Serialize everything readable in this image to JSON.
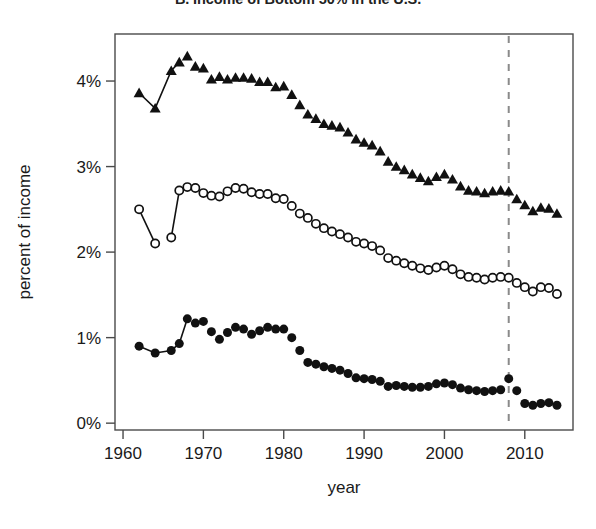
{
  "chart_data": {
    "type": "scatter",
    "title": "B. Income of Bottom 50% in the U.S.",
    "xlabel": "year",
    "ylabel": "percent of income",
    "xlim": [
      1959,
      2016
    ],
    "ylim": [
      -0.08,
      4.55
    ],
    "grid": false,
    "legend": "none",
    "xticks": [
      1960,
      1970,
      1980,
      1990,
      2000,
      2010
    ],
    "xtick_labels": [
      "1960",
      "1970",
      "1980",
      "1990",
      "2000",
      "2010"
    ],
    "yticks": [
      0,
      1,
      2,
      3,
      4
    ],
    "ytick_labels": [
      "0%",
      "1%",
      "2%",
      "3%",
      "4%"
    ],
    "annotations": [
      {
        "type": "vline",
        "x": 2008,
        "style": "dashed",
        "color": "#8a8a8a"
      }
    ],
    "series": [
      {
        "name": "top-series",
        "marker": "filled-triangle",
        "connected_segments": [
          [
            1962,
            1964,
            1966,
            1967
          ]
        ],
        "x": [
          1962,
          1964,
          1966,
          1967,
          1968,
          1969,
          1970,
          1971,
          1972,
          1973,
          1974,
          1975,
          1976,
          1977,
          1978,
          1979,
          1980,
          1981,
          1982,
          1983,
          1984,
          1985,
          1986,
          1987,
          1988,
          1989,
          1990,
          1991,
          1992,
          1993,
          1994,
          1995,
          1996,
          1997,
          1998,
          1999,
          2000,
          2001,
          2002,
          2003,
          2004,
          2005,
          2006,
          2007,
          2008,
          2009,
          2010,
          2011,
          2012,
          2013,
          2014
        ],
        "y": [
          3.86,
          3.68,
          4.12,
          4.22,
          4.29,
          4.17,
          4.15,
          4.02,
          4.05,
          4.02,
          4.04,
          4.04,
          4.03,
          3.99,
          3.99,
          3.93,
          3.94,
          3.84,
          3.72,
          3.61,
          3.56,
          3.5,
          3.48,
          3.46,
          3.4,
          3.32,
          3.28,
          3.25,
          3.18,
          3.06,
          3.0,
          2.96,
          2.91,
          2.87,
          2.83,
          2.88,
          2.91,
          2.85,
          2.77,
          2.72,
          2.71,
          2.69,
          2.71,
          2.72,
          2.71,
          2.62,
          2.55,
          2.48,
          2.52,
          2.51,
          2.45
        ]
      },
      {
        "name": "middle-series",
        "marker": "open-circle",
        "connected_segments": [
          [
            1962,
            1964
          ],
          [
            1966,
            1967
          ]
        ],
        "x": [
          1962,
          1964,
          1966,
          1967,
          1968,
          1969,
          1970,
          1971,
          1972,
          1973,
          1974,
          1975,
          1976,
          1977,
          1978,
          1979,
          1980,
          1981,
          1982,
          1983,
          1984,
          1985,
          1986,
          1987,
          1988,
          1989,
          1990,
          1991,
          1992,
          1993,
          1994,
          1995,
          1996,
          1997,
          1998,
          1999,
          2000,
          2001,
          2002,
          2003,
          2004,
          2005,
          2006,
          2007,
          2008,
          2009,
          2010,
          2011,
          2012,
          2013,
          2014
        ],
        "y": [
          2.5,
          2.1,
          2.17,
          2.72,
          2.76,
          2.75,
          2.69,
          2.66,
          2.65,
          2.71,
          2.75,
          2.74,
          2.7,
          2.68,
          2.68,
          2.63,
          2.62,
          2.54,
          2.45,
          2.4,
          2.33,
          2.28,
          2.24,
          2.21,
          2.17,
          2.12,
          2.1,
          2.07,
          2.02,
          1.93,
          1.9,
          1.87,
          1.84,
          1.81,
          1.79,
          1.82,
          1.84,
          1.8,
          1.74,
          1.71,
          1.7,
          1.68,
          1.7,
          1.71,
          1.7,
          1.64,
          1.59,
          1.54,
          1.59,
          1.58,
          1.51
        ]
      },
      {
        "name": "bottom-series",
        "marker": "filled-circle",
        "connected_segments": [
          [
            1962,
            1964,
            1966,
            1967
          ],
          [
            1967,
            1968
          ]
        ],
        "x": [
          1962,
          1964,
          1966,
          1967,
          1968,
          1969,
          1970,
          1971,
          1972,
          1973,
          1974,
          1975,
          1976,
          1977,
          1978,
          1979,
          1980,
          1981,
          1982,
          1983,
          1984,
          1985,
          1986,
          1987,
          1988,
          1989,
          1990,
          1991,
          1992,
          1993,
          1994,
          1995,
          1996,
          1997,
          1998,
          1999,
          2000,
          2001,
          2002,
          2003,
          2004,
          2005,
          2006,
          2007,
          2008,
          2009,
          2010,
          2011,
          2012,
          2013,
          2014
        ],
        "y": [
          0.9,
          0.82,
          0.85,
          0.93,
          1.22,
          1.17,
          1.19,
          1.07,
          0.98,
          1.06,
          1.12,
          1.1,
          1.04,
          1.08,
          1.12,
          1.1,
          1.1,
          1.0,
          0.85,
          0.71,
          0.69,
          0.66,
          0.64,
          0.62,
          0.58,
          0.53,
          0.52,
          0.51,
          0.49,
          0.43,
          0.44,
          0.43,
          0.42,
          0.42,
          0.43,
          0.46,
          0.47,
          0.45,
          0.41,
          0.39,
          0.38,
          0.37,
          0.38,
          0.39,
          0.52,
          0.38,
          0.23,
          0.21,
          0.23,
          0.24,
          0.21
        ]
      }
    ]
  }
}
